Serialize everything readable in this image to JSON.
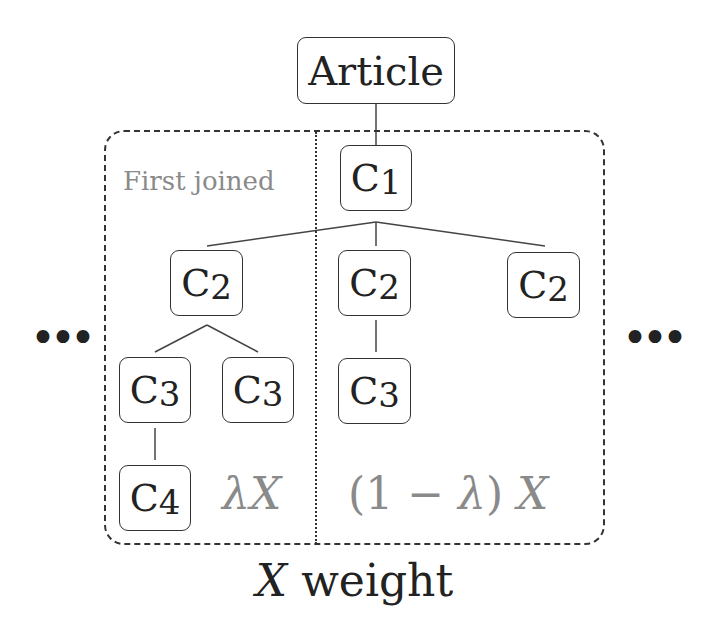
{
  "diagram": {
    "root": {
      "label": "Article"
    },
    "nodes": [
      {
        "id": "c1",
        "letter": "C",
        "level": "1"
      },
      {
        "id": "c2-left",
        "letter": "C",
        "level": "2"
      },
      {
        "id": "c2-mid",
        "letter": "C",
        "level": "2"
      },
      {
        "id": "c2-right",
        "letter": "C",
        "level": "2"
      },
      {
        "id": "c3-a",
        "letter": "C",
        "level": "3"
      },
      {
        "id": "c3-b",
        "letter": "C",
        "level": "3"
      },
      {
        "id": "c3-c",
        "letter": "C",
        "level": "3"
      },
      {
        "id": "c4",
        "letter": "C",
        "level": "4"
      }
    ],
    "region_label": "First joined",
    "left_weight": {
      "lambda": "λ",
      "var": "X"
    },
    "right_weight": {
      "prefix": "(1 − ",
      "lambda": "λ",
      "suffix": ") ",
      "var": "X"
    },
    "ellipsis_left": "•••",
    "ellipsis_right": "•••",
    "caption": {
      "var": "X",
      "text": " weight"
    },
    "colors": {
      "stroke": "#333333",
      "label_gray": "#8a8a8a"
    }
  }
}
